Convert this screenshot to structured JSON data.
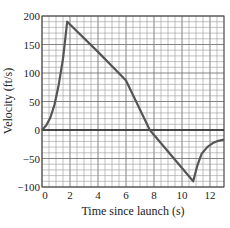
{
  "chart_data": {
    "type": "line",
    "title": "",
    "xlabel": "Time since launch (s)",
    "ylabel": "Velocity (ft/s)",
    "xlim": [
      0,
      13
    ],
    "ylim": [
      -100,
      200
    ],
    "x_ticks": [
      0,
      2,
      4,
      6,
      8,
      10,
      12
    ],
    "x_tick_labels": [
      "0",
      "2",
      "4",
      "6",
      "8",
      "10",
      "12"
    ],
    "y_ticks": [
      -100,
      -50,
      0,
      50,
      100,
      150,
      200
    ],
    "y_tick_labels": [
      "−100",
      "−50",
      "0",
      "50",
      "100",
      "150",
      "200"
    ],
    "grid": true,
    "minor_grid_step_x": 0.5,
    "minor_grid_step_y": 10,
    "legend": null,
    "series": [
      {
        "name": "velocity",
        "color": "#555555",
        "points": [
          [
            0,
            0
          ],
          [
            0.3,
            8
          ],
          [
            0.6,
            22
          ],
          [
            0.9,
            45
          ],
          [
            1.2,
            80
          ],
          [
            1.5,
            125
          ],
          [
            1.8,
            190
          ],
          [
            4,
            137
          ],
          [
            6,
            87
          ],
          [
            7.7,
            0
          ],
          [
            10.8,
            -90
          ],
          [
            11.1,
            -62
          ],
          [
            11.4,
            -42
          ],
          [
            11.8,
            -30
          ],
          [
            12.2,
            -23
          ],
          [
            12.6,
            -19
          ],
          [
            13,
            -17
          ]
        ]
      }
    ],
    "zero_line": true
  }
}
